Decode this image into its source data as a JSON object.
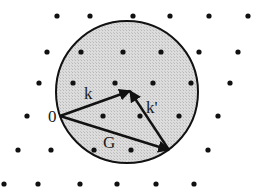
{
  "diagram": {
    "type": "ewald-sphere",
    "circle": {
      "cx": 127,
      "cy": 92,
      "r": 71,
      "fill": "#d9d9d9",
      "stroke": "#111111"
    },
    "lattice_points": [
      [
        57,
        16
      ],
      [
        90,
        16
      ],
      [
        133,
        16
      ],
      [
        170,
        16
      ],
      [
        209,
        16
      ],
      [
        248,
        16
      ],
      [
        47,
        52
      ],
      [
        81,
        52
      ],
      [
        123,
        52
      ],
      [
        161,
        52
      ],
      [
        199,
        52
      ],
      [
        238,
        52
      ],
      [
        39,
        83
      ],
      [
        73,
        83
      ],
      [
        115,
        83
      ],
      [
        153,
        83
      ],
      [
        191,
        83
      ],
      [
        230,
        83
      ],
      [
        27,
        116
      ],
      [
        103,
        116
      ],
      [
        140,
        116
      ],
      [
        179,
        116
      ],
      [
        218,
        116
      ],
      [
        18,
        150
      ],
      [
        51,
        150
      ],
      [
        94,
        150
      ],
      [
        131,
        150
      ],
      [
        208,
        150
      ],
      [
        4,
        184
      ],
      [
        38,
        184
      ],
      [
        80,
        184
      ],
      [
        117,
        184
      ],
      [
        156,
        184
      ],
      [
        194,
        184
      ]
    ],
    "origin": {
      "x": 60,
      "y": 116,
      "label": "0"
    },
    "vectors": [
      {
        "name": "k",
        "label": "k",
        "from": [
          60,
          116
        ],
        "to": [
          130,
          91
        ],
        "label_pos": [
          84,
          99
        ]
      },
      {
        "name": "k-prime",
        "label": "k'",
        "from": [
          169,
          150
        ],
        "to": [
          130,
          91
        ],
        "label_pos": [
          146,
          113
        ]
      },
      {
        "name": "G",
        "label": "G",
        "from": [
          60,
          116
        ],
        "to": [
          169,
          150
        ],
        "label_pos": [
          103,
          148
        ]
      }
    ]
  }
}
